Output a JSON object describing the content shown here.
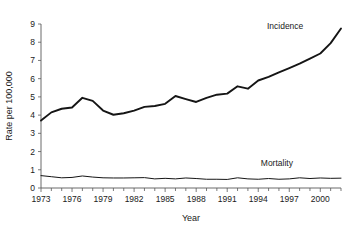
{
  "chart_data": {
    "type": "line",
    "title": "",
    "xlabel": "Year",
    "ylabel": "Rate per 100,000",
    "xlim": [
      1973,
      2002
    ],
    "ylim": [
      0,
      9
    ],
    "grid": false,
    "legend_position": "inline-right",
    "x_tick_labels": [
      "1973",
      "1976",
      "1979",
      "1982",
      "1985",
      "1988",
      "1991",
      "1994",
      "1997",
      "2000"
    ],
    "x_tick_values": [
      1973,
      1976,
      1979,
      1982,
      1985,
      1988,
      1991,
      1994,
      1997,
      2000
    ],
    "x_minor_tick_values": [
      1974,
      1975,
      1977,
      1978,
      1980,
      1981,
      1983,
      1984,
      1986,
      1987,
      1989,
      1990,
      1992,
      1993,
      1995,
      1996,
      1998,
      1999,
      2001,
      2002
    ],
    "y_tick_labels": [
      "0",
      "1",
      "2",
      "3",
      "4",
      "5",
      "6",
      "7",
      "8",
      "9"
    ],
    "y_tick_values": [
      0,
      1,
      2,
      3,
      4,
      5,
      6,
      7,
      8,
      9
    ],
    "x": [
      1973,
      1974,
      1975,
      1976,
      1977,
      1978,
      1979,
      1980,
      1981,
      1982,
      1983,
      1984,
      1985,
      1986,
      1987,
      1988,
      1989,
      1990,
      1991,
      1992,
      1993,
      1994,
      1995,
      1996,
      1997,
      1998,
      1999,
      2000,
      2001,
      2002
    ],
    "series": [
      {
        "name": "Incidence",
        "label": "Incidence",
        "color": "#151515",
        "line_width": 1.9,
        "label_x": 1996.6,
        "label_y": 8.75,
        "values": [
          3.7,
          4.15,
          4.35,
          4.42,
          4.95,
          4.78,
          4.25,
          4.02,
          4.1,
          4.25,
          4.45,
          4.5,
          4.62,
          5.05,
          4.88,
          4.72,
          4.95,
          5.12,
          5.18,
          5.58,
          5.45,
          5.9,
          6.1,
          6.35,
          6.58,
          6.82,
          7.1,
          7.38,
          7.95,
          8.75
        ]
      },
      {
        "name": "Mortality",
        "label": "Mortality",
        "color": "#151515",
        "line_width": 1.0,
        "label_x": 1995.8,
        "label_y": 1.18,
        "values": [
          0.68,
          0.62,
          0.56,
          0.58,
          0.66,
          0.6,
          0.56,
          0.55,
          0.55,
          0.56,
          0.57,
          0.5,
          0.53,
          0.5,
          0.55,
          0.52,
          0.48,
          0.48,
          0.47,
          0.56,
          0.5,
          0.48,
          0.52,
          0.48,
          0.5,
          0.56,
          0.52,
          0.55,
          0.53,
          0.54
        ]
      }
    ]
  },
  "axes": {
    "x_axis_title": "Year",
    "y_axis_title": "Rate per 100,000"
  }
}
